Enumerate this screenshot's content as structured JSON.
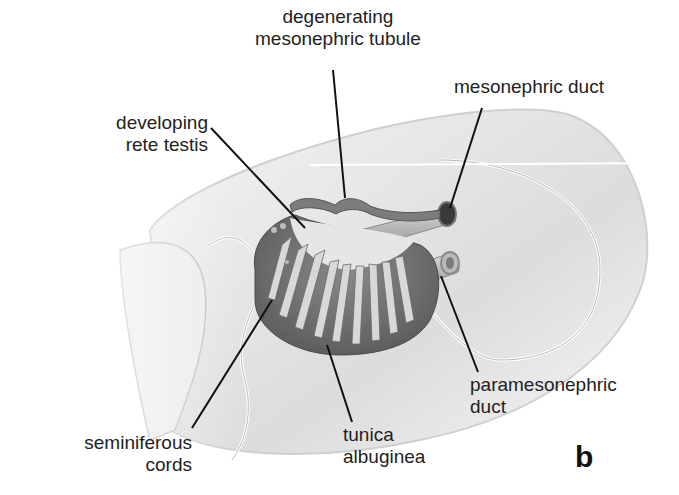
{
  "figure": {
    "panel_letter": "b",
    "labels": {
      "degenerating_tubule": [
        "degenerating",
        "mesonephric tubule"
      ],
      "mesonephric_duct": [
        "mesonephric duct"
      ],
      "rete_testis": [
        "developing",
        "rete testis"
      ],
      "paramesonephric_duct": [
        "paramesonephric",
        "duct"
      ],
      "seminiferous_cords": [
        "seminiferous",
        "cords"
      ],
      "tunica_albuginea": [
        "tunica",
        "albuginea"
      ]
    },
    "colors": {
      "background": "#ffffff",
      "tissue_light": "#e8e8e8",
      "tissue_mid": "#c8c8c8",
      "gonad_dark": "#6e6e6e",
      "leader_line": "#111111",
      "text": "#222222"
    }
  }
}
